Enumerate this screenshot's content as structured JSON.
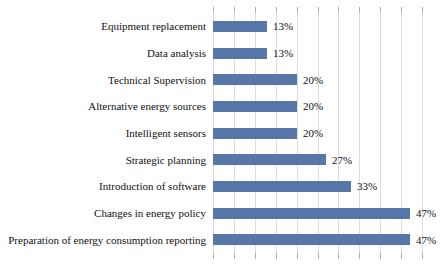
{
  "chart": {
    "background_color": "#ffffff",
    "bar_color": "#5677a8",
    "gridline_color": "#dcdcdc",
    "tick_color": "#b0b0b0",
    "text_color": "#111111"
  },
  "chart_data": {
    "type": "bar",
    "orientation": "horizontal",
    "title": "",
    "categories": [
      "Equipment replacement",
      "Data analysis",
      "Technical Supervision",
      "Alternative energy sources",
      "Intelligent sensors",
      "Strategic planning",
      "Introduction of software",
      "Changes in energy policy",
      "Preparation of energy consumption reporting"
    ],
    "values": [
      13,
      13,
      20,
      20,
      20,
      27,
      33,
      47,
      47
    ],
    "value_labels": [
      "13%",
      "13%",
      "20%",
      "20%",
      "20%",
      "27%",
      "33%",
      "47%",
      "47%"
    ],
    "xlabel": "",
    "ylabel": "",
    "xlim": [
      0,
      55
    ],
    "gridline_step": 5,
    "grid": true,
    "legend": false,
    "data_labels": "outside-end"
  }
}
